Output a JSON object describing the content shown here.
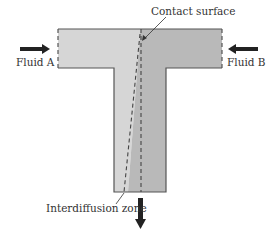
{
  "diagram": {
    "type": "T-junction microfluidic mixer",
    "labels": {
      "contact_surface": "Contact surface",
      "fluid_a": "Fluid A",
      "fluid_b": "Fluid B",
      "interdiffusion_zone": "Interdiffusion zone"
    },
    "colors": {
      "fluid_a_fill": "#d4d4d4",
      "fluid_b_fill": "#b8b8b8",
      "outline": "#555555",
      "arrow": "#222222"
    }
  }
}
